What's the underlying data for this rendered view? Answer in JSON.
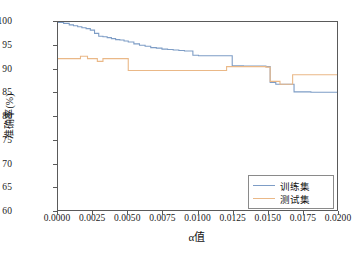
{
  "chart_data": {
    "type": "line",
    "title": "",
    "xlabel": "α值",
    "ylabel": "准确率(%)",
    "xlim": [
      0.0,
      0.02
    ],
    "ylim": [
      60,
      100
    ],
    "grid": false,
    "legend_position": "lower right",
    "drawstyle": "steps-post",
    "xticks": [
      "0.0000",
      "0.0025",
      "0.0050",
      "0.0075",
      "0.0100",
      "0.0125",
      "0.0150",
      "0.0175",
      "0.0200"
    ],
    "xtick_values": [
      0.0,
      0.0025,
      0.005,
      0.0075,
      0.01,
      0.0125,
      0.015,
      0.0175,
      0.02
    ],
    "yticks": [
      "60",
      "65",
      "70",
      "75",
      "80",
      "85",
      "90",
      "95",
      "100"
    ],
    "ytick_values": [
      60,
      65,
      70,
      75,
      80,
      85,
      90,
      95,
      100
    ],
    "series": [
      {
        "name": "训练集",
        "color": "#7e9dc6",
        "x": [
          0.0,
          0.0004,
          0.0008,
          0.0011,
          0.0014,
          0.0017,
          0.002,
          0.0023,
          0.0026,
          0.0029,
          0.0032,
          0.0035,
          0.0038,
          0.0041,
          0.0044,
          0.0047,
          0.005,
          0.0054,
          0.0058,
          0.0062,
          0.0066,
          0.007,
          0.0074,
          0.0078,
          0.0082,
          0.0086,
          0.009,
          0.0093,
          0.0096,
          0.01,
          0.0105,
          0.011,
          0.0119,
          0.0124,
          0.0132,
          0.014,
          0.0148,
          0.0151,
          0.0155,
          0.0162,
          0.0168,
          0.018,
          0.0193,
          0.02
        ],
        "y": [
          99.9,
          99.7,
          99.4,
          99.2,
          99.0,
          98.8,
          98.6,
          98.3,
          97.6,
          97.0,
          96.9,
          96.7,
          96.5,
          96.3,
          96.2,
          96.0,
          95.8,
          95.4,
          95.1,
          94.9,
          94.6,
          94.5,
          94.3,
          94.2,
          94.1,
          94.0,
          93.9,
          93.9,
          93.0,
          92.9,
          92.9,
          92.9,
          92.9,
          90.8,
          90.7,
          90.7,
          90.6,
          87.3,
          86.9,
          86.9,
          85.3,
          85.2,
          85.2,
          85.2
        ]
      },
      {
        "name": "测试集",
        "color": "#eab887",
        "x": [
          0.0,
          0.0012,
          0.0016,
          0.0021,
          0.0025,
          0.0028,
          0.0032,
          0.005,
          0.0092,
          0.012,
          0.013,
          0.014,
          0.0148,
          0.0151,
          0.0158,
          0.0167,
          0.0192,
          0.02
        ],
        "y": [
          92.3,
          92.3,
          92.8,
          92.3,
          92.3,
          91.7,
          92.3,
          89.8,
          89.8,
          90.6,
          90.6,
          90.6,
          90.5,
          87.5,
          86.9,
          88.9,
          88.9,
          84.3
        ]
      }
    ]
  },
  "axis": {
    "frame_color": "#5a5a5a"
  },
  "legend": {
    "entries": [
      {
        "label": "训练集",
        "color": "#7e9dc6"
      },
      {
        "label": "测试集",
        "color": "#eab887"
      }
    ]
  }
}
